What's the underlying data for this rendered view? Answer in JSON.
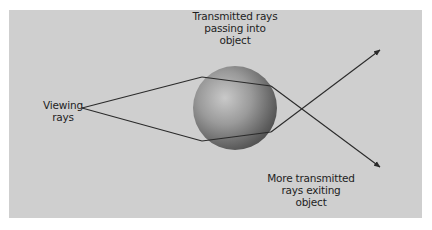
{
  "figure": {
    "background_color": "#cfcfcf",
    "line_color": "#2a2a2a",
    "labels": {
      "viewing_rays": [
        "Viewing",
        "rays"
      ],
      "transmitted_in": [
        "Transmitted rays",
        "passing into",
        "object"
      ],
      "transmitted_out": [
        "More transmitted",
        "rays exiting",
        "object"
      ]
    },
    "elements": {
      "sphere": {
        "shape": "sphere",
        "shading": "gray-gradient"
      },
      "rays": [
        {
          "name": "upper-viewing-ray",
          "description": "enters top of sphere, exits crossing downward to lower-right arrow"
        },
        {
          "name": "lower-viewing-ray",
          "description": "enters bottom of sphere, exits crossing upward to upper-right arrow"
        }
      ]
    }
  }
}
